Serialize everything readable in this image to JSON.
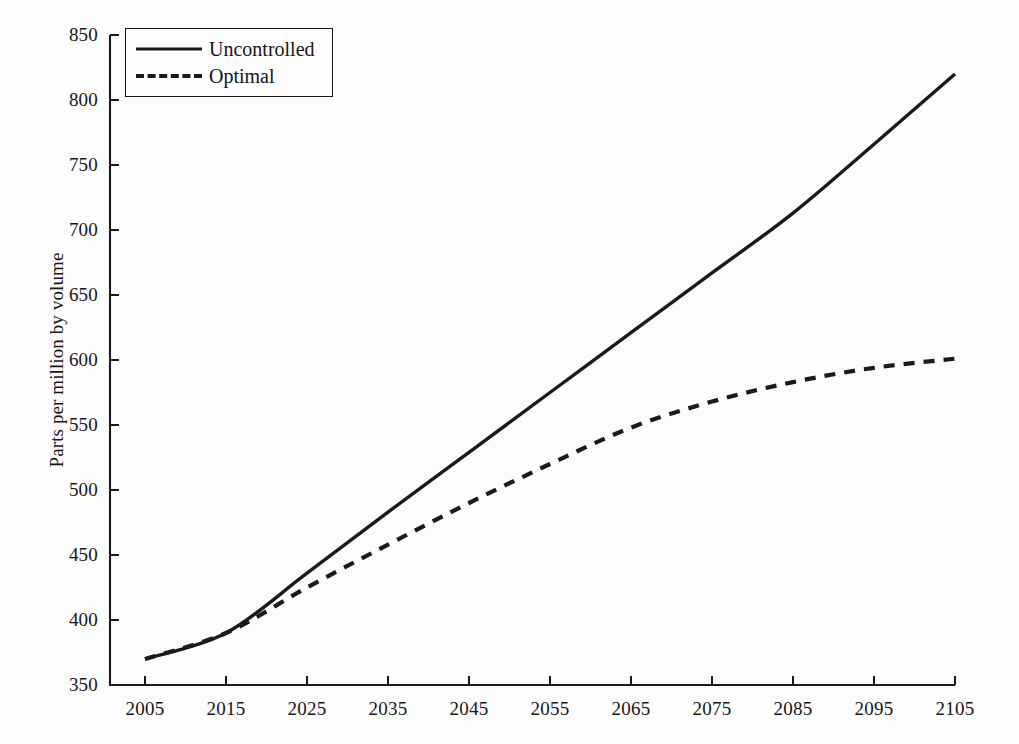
{
  "chart_data": {
    "type": "line",
    "title": "",
    "subtitle": "",
    "xlabel": "",
    "ylabel": "Parts per million by volume",
    "xlim": [
      2005,
      2105
    ],
    "ylim": [
      350,
      850
    ],
    "grid": false,
    "legend_position": "top-left",
    "xticks": [
      2005,
      2015,
      2025,
      2035,
      2045,
      2055,
      2065,
      2075,
      2085,
      2095,
      2105
    ],
    "yticks": [
      350,
      400,
      450,
      500,
      550,
      600,
      650,
      700,
      750,
      800,
      850
    ],
    "x": [
      2005,
      2015,
      2025,
      2035,
      2045,
      2055,
      2065,
      2075,
      2085,
      2095,
      2105
    ],
    "series": [
      {
        "name": "Uncontrolled",
        "style": "solid",
        "color": "#1a1a1a",
        "values": [
          370,
          390,
          436,
          483,
          529,
          575,
          621,
          667,
          713,
          766,
          820
        ]
      },
      {
        "name": "Optimal",
        "style": "dashed",
        "color": "#1a1a1a",
        "values": [
          370,
          390,
          425,
          458,
          490,
          520,
          548,
          568,
          583,
          594,
          601
        ]
      }
    ]
  },
  "axes": {
    "y_axis_label": "Parts per million by volume",
    "y_tick_labels": [
      "850",
      "800",
      "750",
      "700",
      "650",
      "600",
      "550",
      "500",
      "450",
      "400",
      "350"
    ],
    "x_tick_labels": [
      "2005",
      "2015",
      "2025",
      "2035",
      "2045",
      "2055",
      "2065",
      "2075",
      "2085",
      "2095",
      "2105"
    ]
  },
  "legend": {
    "entries": [
      {
        "label": "Uncontrolled",
        "style": "solid"
      },
      {
        "label": "Optimal",
        "style": "dashed"
      }
    ]
  },
  "colors": {
    "line": "#1a1a1a",
    "axis": "#1a1a1a",
    "background": "#fcfcfc",
    "text": "#171717"
  }
}
